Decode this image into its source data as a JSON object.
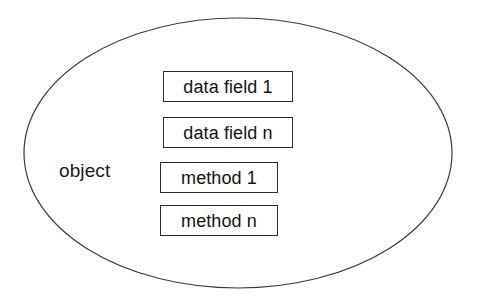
{
  "diagram": {
    "title": "object",
    "canvas": {
      "width": 480,
      "height": 301,
      "background_color": "#ffffff"
    },
    "ellipse": {
      "name": "object boundary",
      "center_x": 238,
      "center_y": 153,
      "radius_x": 214,
      "radius_y": 135,
      "stroke_color": "#3a3a3a",
      "stroke_width": 1.2,
      "fill_color": "#ffffff"
    },
    "object_label": "object",
    "members": [
      {
        "label": "data field 1",
        "kind": "data-field"
      },
      {
        "label": "data field n",
        "kind": "data-field"
      },
      {
        "label": "method 1",
        "kind": "method"
      },
      {
        "label": "method n",
        "kind": "method"
      }
    ],
    "colors": {
      "box_border": "#2b2b2b",
      "box_fill": "#ffffff",
      "text": "#141414"
    }
  }
}
